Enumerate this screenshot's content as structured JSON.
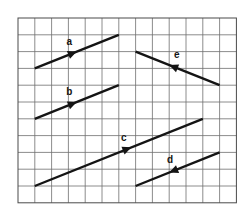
{
  "diagram": {
    "type": "vector-grid",
    "grid": {
      "columns": 13,
      "rows": 11
    },
    "colors": {
      "grid": "#6e6e6e",
      "vector": "#141414",
      "background": "#ffffff"
    },
    "vectors": [
      {
        "label": "a",
        "from": [
          1,
          3
        ],
        "to": [
          6,
          1
        ],
        "arrow_at": 0.45
      },
      {
        "label": "b",
        "from": [
          1,
          6
        ],
        "to": [
          6,
          4
        ],
        "arrow_at": 0.45
      },
      {
        "label": "c",
        "from": [
          1,
          10
        ],
        "to": [
          11,
          6
        ],
        "arrow_at": 0.55
      },
      {
        "label": "d",
        "from": [
          12,
          8
        ],
        "to": [
          7,
          10
        ],
        "arrow_at": 0.55
      },
      {
        "label": "e",
        "from": [
          12,
          4
        ],
        "to": [
          7,
          2
        ],
        "arrow_at": 0.55
      }
    ]
  }
}
